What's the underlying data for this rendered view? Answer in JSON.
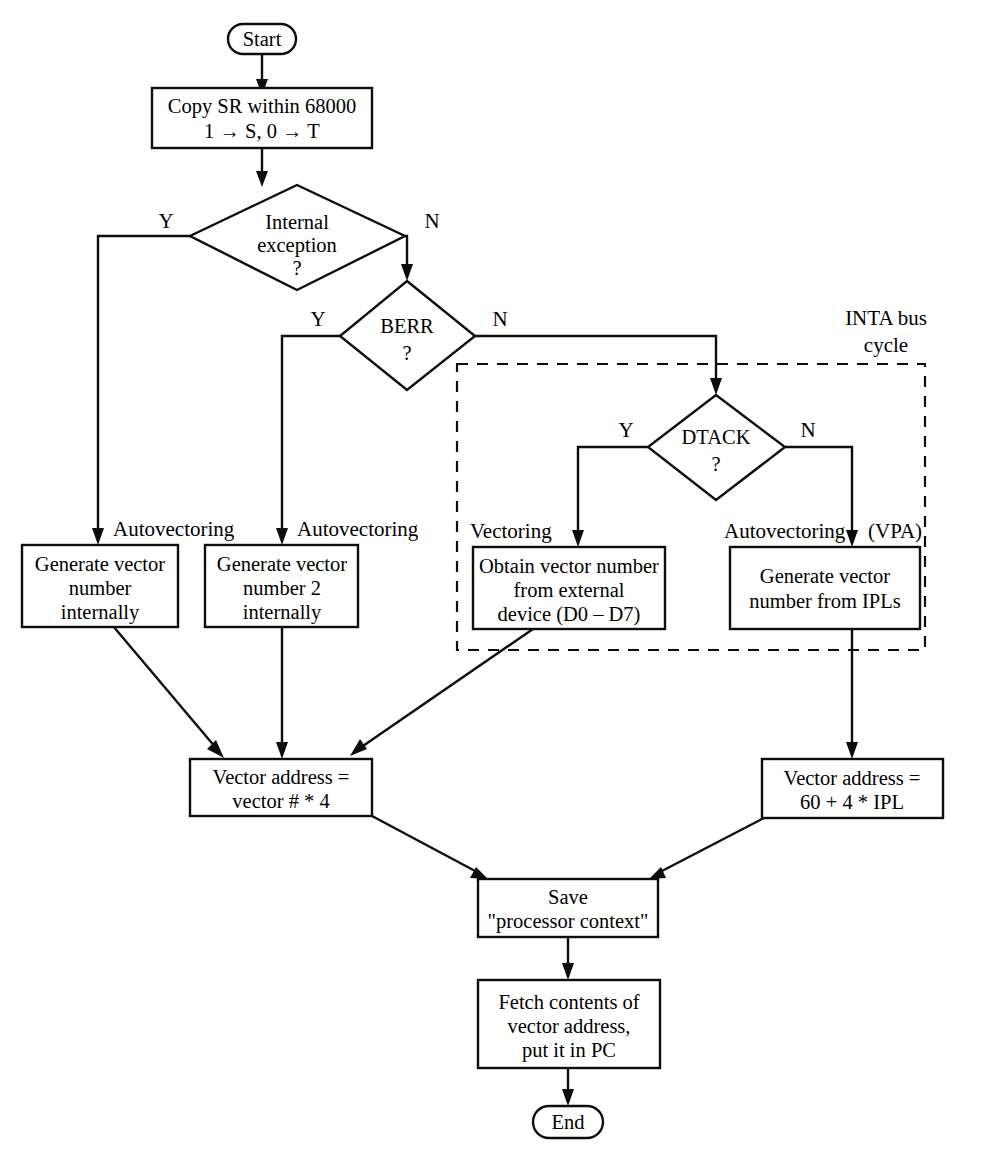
{
  "diagram": {
    "background_color": "#ffffff",
    "line_color": "#0d0d0d",
    "text_color": "#000000"
  },
  "nodes": {
    "start": {
      "label": "Start",
      "shape": "terminator"
    },
    "copy_sr": {
      "line1": "Copy SR within 68000",
      "line2": "1 → S, 0 → T",
      "shape": "process"
    },
    "internal_exception": {
      "line1": "Internal",
      "line2": "exception",
      "line3": "?",
      "shape": "decision"
    },
    "berr": {
      "line1": "BERR",
      "line2": "?",
      "shape": "decision"
    },
    "dtack": {
      "line1": "DTACK",
      "line2": "?",
      "shape": "decision"
    },
    "gen_vec_internal": {
      "line1": "Generate vector",
      "line2": "number",
      "line3": "internally",
      "shape": "process"
    },
    "gen_vec_2_internal": {
      "line1": "Generate vector",
      "line2": "number 2",
      "line3": "internally",
      "shape": "process"
    },
    "obtain_vec_external": {
      "line1": "Obtain vector number",
      "line2": "from external",
      "line3": "device (D0 – D7)",
      "shape": "process"
    },
    "gen_vec_ipl": {
      "line1": "Generate vector",
      "line2": "number from IPLs",
      "shape": "process"
    },
    "vector_address_times4": {
      "line1": "Vector address =",
      "line2": "vector # * 4",
      "shape": "process"
    },
    "vector_address_ipl": {
      "line1": "Vector address =",
      "line2": "60 + 4 * IPL",
      "shape": "process"
    },
    "save_context": {
      "line1": "Save",
      "line2": "\"processor context\"",
      "shape": "process"
    },
    "fetch_contents": {
      "line1": "Fetch contents of",
      "line2": "vector address,",
      "line3": "put it in PC",
      "shape": "process"
    },
    "end": {
      "label": "End",
      "shape": "terminator"
    }
  },
  "branch_labels": {
    "internal_exception_yes": "Y",
    "internal_exception_no": "N",
    "berr_yes": "Y",
    "berr_no": "N",
    "dtack_yes": "Y",
    "dtack_no": "N"
  },
  "edge_labels": {
    "autovectoring_left": "Autovectoring",
    "autovectoring_mid": "Autovectoring",
    "vectoring": "Vectoring",
    "autovectoring_right": "Autovectoring",
    "vpa": "(VPA)"
  },
  "regions": {
    "inta_bus_cycle": {
      "line1": "INTA bus",
      "line2": "cycle",
      "style": "dashed"
    }
  }
}
